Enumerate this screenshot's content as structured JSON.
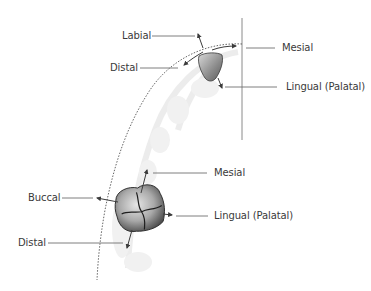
{
  "diagram": {
    "colors": {
      "background": "#ffffff",
      "label_text": "#3a3a3a",
      "leader_line": "#707070",
      "arch_line": "#555555",
      "arrow": "#3c3c3c",
      "tooth_fill": "#a8a8a8",
      "gum_shadow": "#ececec"
    },
    "anterior_tooth": {
      "name": "Incisor",
      "labels": {
        "labial": "Labial",
        "distal": "Distal",
        "mesial": "Mesial",
        "lingual": "Lingual (Palatal)"
      }
    },
    "posterior_tooth": {
      "name": "Molar",
      "labels": {
        "mesial": "Mesial",
        "buccal": "Buccal",
        "lingual": "Lingual (Palatal)",
        "distal": "Distal"
      }
    },
    "reference_lines": {
      "midline": "vertical midline",
      "arch": "dotted dental arch curve"
    }
  }
}
